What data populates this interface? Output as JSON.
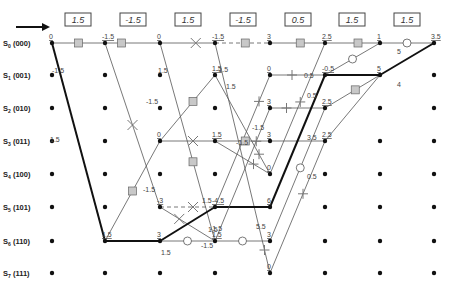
{
  "colors": {
    "thin_line": "#555555",
    "thick_line": "#111111",
    "node": "#111111",
    "square_fill": "#c8c8c8",
    "text": "#444444"
  },
  "received": [
    "1.5",
    "-1.5",
    "1.5",
    "-1.5",
    "0.5",
    "1.5",
    "1.5"
  ],
  "states": [
    "S0 (000)",
    "S1 (001)",
    "S2 (010)",
    "S3 (011)",
    "S4 (100)",
    "S5 (101)",
    "S6 (110)",
    "S7 (111)"
  ],
  "state_labels": [
    {
      "main": "S",
      "sub": "0",
      "code": "(000)"
    },
    {
      "main": "S",
      "sub": "1",
      "code": "(001)"
    },
    {
      "main": "S",
      "sub": "2",
      "code": "(010)"
    },
    {
      "main": "S",
      "sub": "3",
      "code": "(011)"
    },
    {
      "main": "S",
      "sub": "4",
      "code": "(100)"
    },
    {
      "main": "S",
      "sub": "5",
      "code": "(101)"
    },
    {
      "main": "S",
      "sub": "6",
      "code": "(110)"
    },
    {
      "main": "S",
      "sub": "7",
      "code": "(111)"
    }
  ],
  "path_metrics": [
    {
      "col": 0,
      "row": 0,
      "text": "0"
    },
    {
      "col": 1,
      "row": 0,
      "text": "-1.5"
    },
    {
      "col": 1,
      "row": 6,
      "text": "1.5"
    },
    {
      "col": 2,
      "row": 0,
      "text": "0"
    },
    {
      "col": 2,
      "row": 3,
      "text": "0"
    },
    {
      "col": 2,
      "row": 5,
      "text": "-3"
    },
    {
      "col": 2,
      "row": 6,
      "text": "3"
    },
    {
      "col": 3,
      "row": 0,
      "text": "-1.5"
    },
    {
      "col": 3,
      "row": 1,
      "text": "1.5"
    },
    {
      "col": 3,
      "row": 3,
      "text": "1.5"
    },
    {
      "col": 3,
      "row": 5,
      "text": "-4.5"
    },
    {
      "col": 3,
      "row": 6,
      "text": "1.5"
    },
    {
      "col": 4,
      "row": 0,
      "text": "3"
    },
    {
      "col": 4,
      "row": 1,
      "text": "0"
    },
    {
      "col": 4,
      "row": 2,
      "text": "3"
    },
    {
      "col": 4,
      "row": 3,
      "text": "3"
    },
    {
      "col": 4,
      "row": 4,
      "text": "0"
    },
    {
      "col": 4,
      "row": 5,
      "text": "6"
    },
    {
      "col": 4,
      "row": 6,
      "text": "3"
    },
    {
      "col": 4,
      "row": 7,
      "text": "0"
    },
    {
      "col": 5,
      "row": 0,
      "text": "2.5"
    },
    {
      "col": 5,
      "row": 1,
      "text": "-0.5"
    },
    {
      "col": 5,
      "row": 2,
      "text": "2.5"
    },
    {
      "col": 5,
      "row": 3,
      "text": "2.5"
    },
    {
      "col": 6,
      "row": 0,
      "text": "1"
    },
    {
      "col": 6,
      "row": 1,
      "text": "5"
    },
    {
      "col": 7,
      "row": 0,
      "text": "3.5"
    }
  ],
  "branch_labels": [
    {
      "x": 22,
      "y": 73,
      "text": "-1.5"
    },
    {
      "x": 128,
      "y": 73,
      "text": "1.5"
    },
    {
      "x": 186,
      "y": 72,
      "text": "-1.5"
    },
    {
      "x": 20,
      "y": 142,
      "text": "1.5"
    },
    {
      "x": 116,
      "y": 104,
      "text": "-1.5"
    },
    {
      "x": 113,
      "y": 192,
      "text": "-1.5"
    },
    {
      "x": 131,
      "y": 255,
      "text": "1.5"
    },
    {
      "x": 196,
      "y": 89,
      "text": "1.5"
    },
    {
      "x": 172,
      "y": 203,
      "text": "1.5"
    },
    {
      "x": 178,
      "y": 232,
      "text": "1.5"
    },
    {
      "x": 171,
      "y": 248,
      "text": "-1.5"
    },
    {
      "x": 206,
      "y": 145,
      "text": "-1.5"
    },
    {
      "x": 180,
      "y": 231,
      "text": "-1.5"
    },
    {
      "x": 222,
      "y": 130,
      "text": "-1.5"
    },
    {
      "x": 226,
      "y": 229,
      "text": "5.5"
    },
    {
      "x": 274,
      "y": 78,
      "text": "0.5"
    },
    {
      "x": 277,
      "y": 98,
      "text": "0.5"
    },
    {
      "x": 277,
      "y": 140,
      "text": "3.5"
    },
    {
      "x": 277,
      "y": 179,
      "text": "0.5"
    },
    {
      "x": 367,
      "y": 54,
      "text": "5"
    },
    {
      "x": 367,
      "y": 87,
      "text": "4"
    },
    {
      "x": 430,
      "y": 56,
      "text": "6.5"
    }
  ],
  "arrow": {
    "direction": "right"
  }
}
